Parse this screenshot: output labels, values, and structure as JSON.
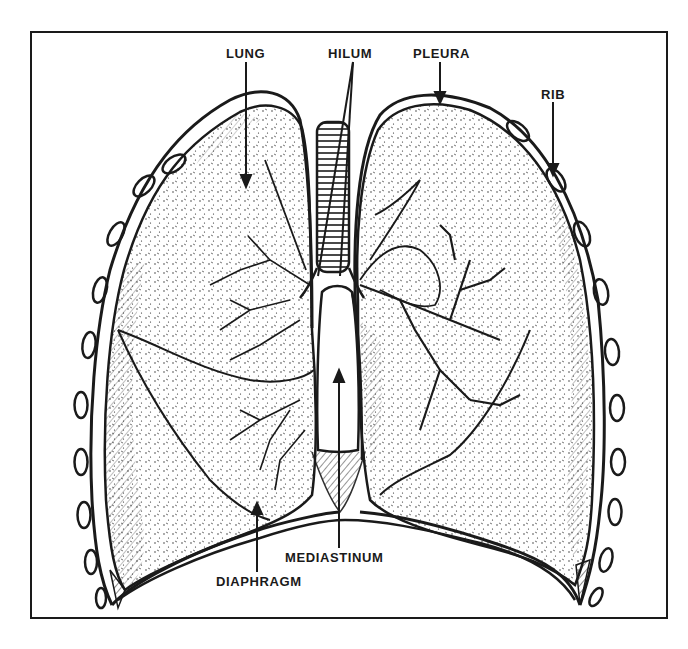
{
  "figure": {
    "ink_color": "#1a1a1a",
    "background_color": "#ffffff"
  },
  "labels": {
    "lung": "LUNG",
    "hilum": "HILUM",
    "pleura": "PLEURA",
    "rib": "RIB",
    "mediastinum": "MEDIASTINUM",
    "diaphragm": "DIAPHRAGM"
  }
}
